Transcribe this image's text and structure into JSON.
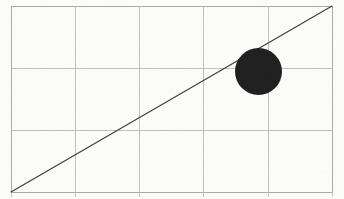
{
  "figure": {
    "background_color": "#fdfdfc",
    "width": 344,
    "height": 199
  },
  "chart_data": {
    "type": "scatter",
    "title": "",
    "subtitle": "",
    "xlabel": "",
    "ylabel": "",
    "grid": true,
    "legend": null,
    "legend_position": "none",
    "axis_tick_labels": {
      "x": [],
      "y": []
    },
    "plot_area_px": {
      "left": 11,
      "top": 6,
      "right": 332,
      "bottom": 192
    },
    "grid_lines": {
      "vertical_x_px": [
        11,
        75,
        139,
        203,
        268,
        332
      ],
      "horizontal_y_px": [
        6,
        68,
        130,
        192
      ],
      "color": "#b9b9b9",
      "columns": 5,
      "rows": 3
    },
    "x_axis_tick_marks_px": [
      11,
      75,
      139,
      203,
      268,
      332
    ],
    "series": [
      {
        "name": "diagonal-line",
        "type": "line",
        "color": "#3a3a3a",
        "stroke_width_px": 1.15,
        "points_px": [
          {
            "x": 11,
            "y": 192
          },
          {
            "x": 332,
            "y": 6
          }
        ],
        "slope_px": -0.579,
        "description": "Straight line from bottom-left corner of grid to top-right corner of grid"
      },
      {
        "name": "filled-circle",
        "type": "scatter",
        "color": "#1c1c1c",
        "points_px": [
          {
            "x": 258.5,
            "y": 71.5,
            "r": 23.5
          }
        ],
        "description": "Solid black disc centred in the upper-right region, intersected by the diagonal line near its upper-left edge"
      }
    ],
    "annotations": []
  }
}
